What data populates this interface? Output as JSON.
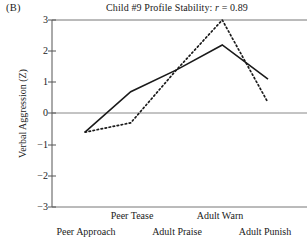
{
  "panel": {
    "label": "(B)"
  },
  "chart_data": {
    "type": "line",
    "title": "Child #9 Profile Stability: r = 0.89",
    "title_prefix": "Child #9 Profile Stability:",
    "title_stat_symbol": "r",
    "title_stat_value": "= 0.89",
    "xlabel": "",
    "ylabel": "Verbal Aggression (Z)",
    "ylim": [
      -3,
      3
    ],
    "yticks": [
      3,
      2,
      1,
      0,
      -1,
      -2,
      -3
    ],
    "ytick_labels": [
      "3",
      "2",
      "1",
      "0",
      "−1",
      "−2",
      "−3"
    ],
    "grid": false,
    "zero_line": true,
    "legend": "none",
    "categories": [
      "Peer Approach",
      "Peer Tease",
      "Adult Praise",
      "Adult Warn",
      "Adult Punish"
    ],
    "series": [
      {
        "name": "Time 1",
        "style": "solid",
        "color": "#1a1a1a",
        "values": [
          -0.6,
          0.7,
          1.4,
          2.2,
          1.1
        ]
      },
      {
        "name": "Time 2",
        "style": "dotted",
        "color": "#1a1a1a",
        "values": [
          -0.6,
          -0.3,
          1.4,
          3.0,
          0.35
        ]
      }
    ]
  }
}
